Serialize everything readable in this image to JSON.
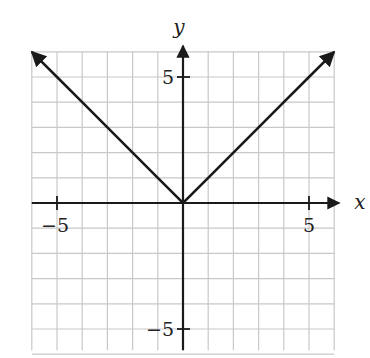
{
  "chart_data": {
    "type": "line",
    "title": "",
    "function": "y = |x|",
    "xlabel": "x",
    "ylabel": "y",
    "xlim": [
      -6,
      6
    ],
    "ylim": [
      -6,
      6
    ],
    "grid": true,
    "grid_step": 1,
    "x_tick_labels": [
      {
        "value": -5,
        "label": "−5"
      },
      {
        "value": 5,
        "label": "5"
      }
    ],
    "y_tick_labels": [
      {
        "value": 5,
        "label": "5"
      },
      {
        "value": -5,
        "label": "−5"
      }
    ],
    "series": [
      {
        "name": "y = |x|",
        "x": [
          -6,
          -5,
          -4,
          -3,
          -2,
          -1,
          0,
          1,
          2,
          3,
          4,
          5,
          6
        ],
        "values": [
          6,
          5,
          4,
          3,
          2,
          1,
          0,
          1,
          2,
          3,
          4,
          5,
          6
        ],
        "arrows_at_ends": true
      }
    ],
    "legend": null
  },
  "colors": {
    "grid": "#c8c8c8",
    "axis": "#1a1a1a",
    "curve": "#1a1a1a",
    "background": "#ffffff"
  }
}
